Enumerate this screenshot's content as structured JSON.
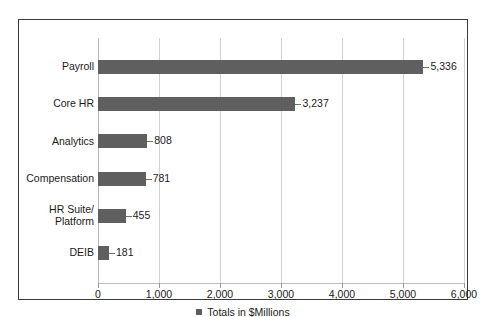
{
  "chart_data": {
    "type": "bar",
    "orientation": "horizontal",
    "title": "",
    "xlabel": "",
    "ylabel": "",
    "categories": [
      "Payroll",
      "Core HR",
      "Analytics",
      "Compensation",
      "HR Suite/\nPlatform",
      "DEIB"
    ],
    "values": [
      5336,
      3237,
      808,
      781,
      455,
      181
    ],
    "value_labels": [
      "5,336",
      "3,237",
      "808",
      "781",
      "455",
      "181"
    ],
    "xlim": [
      0,
      6000
    ],
    "xticks": [
      0,
      1000,
      2000,
      3000,
      4000,
      5000,
      6000
    ],
    "xtick_labels": [
      "0",
      "1,000",
      "2,000",
      "3,000",
      "4,000",
      "5,000",
      "6,000"
    ],
    "grid": "vertical",
    "legend": {
      "position": "bottom",
      "entries": [
        {
          "label": "Totals in $Millions",
          "color": "#5f5f5f",
          "marker": "square"
        }
      ]
    },
    "colors": {
      "bar": "#5f5f5f",
      "gridline": "#d2d2d2",
      "frame": "#3a3a3a",
      "text": "#1a1a1a",
      "background": "#ffffff"
    }
  },
  "category_lines": [
    [
      "Payroll"
    ],
    [
      "Core HR"
    ],
    [
      "Analytics"
    ],
    [
      "Compensation"
    ],
    [
      "HR Suite/",
      "Platform"
    ],
    [
      "DEIB"
    ]
  ]
}
